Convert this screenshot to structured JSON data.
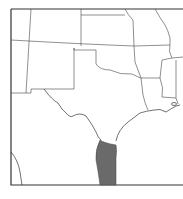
{
  "map": {
    "region": "South-central United States and northeastern Mexico",
    "highlight_color": "#6a6a6a",
    "border_color": "#444444",
    "background": "#ffffff",
    "highlight": "Shaded distribution range along southern Texas Gulf coast into Tamaulipas, Mexico"
  }
}
